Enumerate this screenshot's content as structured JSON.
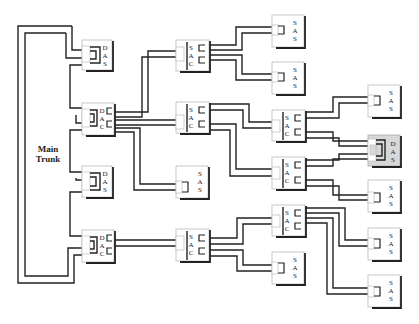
{
  "diagram": {
    "type": "network topology",
    "trunk_label_line1": "Main",
    "trunk_label_line2": "Trunk",
    "node_types": {
      "DAS": "D A S",
      "DAC": "D A C",
      "SAC": "S A C",
      "SAS": "S A S"
    },
    "colors": {
      "line": "#222222",
      "box_fill": "#ffffff",
      "highlight_fill": "#d8d8d8",
      "shadow": "#222222"
    },
    "nodes": [
      {
        "id": "das-1",
        "type": "DAS",
        "letters": [
          "D",
          "A",
          "S"
        ]
      },
      {
        "id": "dac-1",
        "type": "DAC",
        "letters": [
          "D",
          "A",
          "C"
        ]
      },
      {
        "id": "das-2",
        "type": "DAS",
        "letters": [
          "D",
          "A",
          "S"
        ]
      },
      {
        "id": "dac-2",
        "type": "DAC",
        "letters": [
          "D",
          "A",
          "C"
        ]
      },
      {
        "id": "sac-1",
        "type": "SAC",
        "letters": [
          "S",
          "A",
          "C"
        ]
      },
      {
        "id": "sac-2",
        "type": "SAC",
        "letters": [
          "S",
          "A",
          "C"
        ]
      },
      {
        "id": "sas-1",
        "type": "SAS",
        "letters": [
          "S",
          "A",
          "S"
        ]
      },
      {
        "id": "sac-3",
        "type": "SAC",
        "letters": [
          "S",
          "A",
          "C"
        ]
      },
      {
        "id": "sas-2",
        "type": "SAS",
        "letters": [
          "S",
          "A",
          "S"
        ]
      },
      {
        "id": "sas-3",
        "type": "SAS",
        "letters": [
          "S",
          "A",
          "S"
        ]
      },
      {
        "id": "sac-4",
        "type": "SAC",
        "letters": [
          "S",
          "A",
          "C"
        ]
      },
      {
        "id": "sac-5",
        "type": "SAC",
        "letters": [
          "S",
          "A",
          "C"
        ]
      },
      {
        "id": "sac-6",
        "type": "SAC",
        "letters": [
          "S",
          "A",
          "C"
        ]
      },
      {
        "id": "sas-4",
        "type": "SAS",
        "letters": [
          "S",
          "A",
          "S"
        ]
      },
      {
        "id": "sas-5",
        "type": "SAS",
        "letters": [
          "S",
          "A",
          "S"
        ]
      },
      {
        "id": "das-3",
        "type": "DAS",
        "letters": [
          "D",
          "A",
          "S"
        ],
        "highlighted": true
      },
      {
        "id": "sas-6",
        "type": "SAS",
        "letters": [
          "S",
          "A",
          "S"
        ]
      },
      {
        "id": "sas-7",
        "type": "SAS",
        "letters": [
          "S",
          "A",
          "S"
        ]
      },
      {
        "id": "sas-8",
        "type": "SAS",
        "letters": [
          "S",
          "A",
          "S"
        ]
      }
    ]
  }
}
